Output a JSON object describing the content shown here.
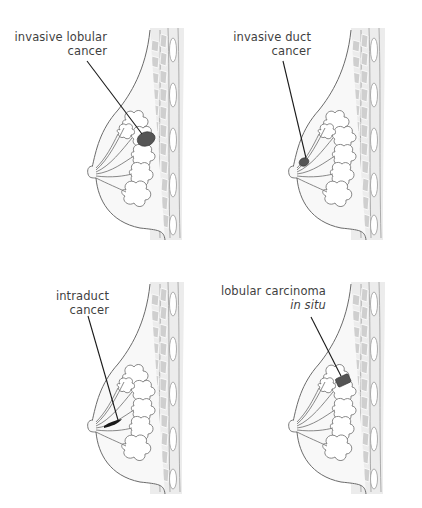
{
  "figure": {
    "panels": [
      {
        "id": "invasive-lobular",
        "label_lines": [
          "invasive lobular",
          "cancer"
        ],
        "italic_line": null
      },
      {
        "id": "invasive-duct",
        "label_lines": [
          "invasive duct",
          "cancer"
        ],
        "italic_line": null
      },
      {
        "id": "intraduct",
        "label_lines": [
          "intraduct",
          "cancer"
        ],
        "italic_line": null
      },
      {
        "id": "lobular-carcinoma-in-situ",
        "label_lines": [
          "lobular carcinoma"
        ],
        "italic_line": "in situ"
      }
    ],
    "colors": {
      "outline": "#6b6b6b",
      "tissue_fill": "#f7f7f7",
      "muscle_fill": "#d4d4d4",
      "tumor_fill": "#555555",
      "pointer_line": "#1a1a1a",
      "label_text": "#3f3f3f"
    }
  }
}
